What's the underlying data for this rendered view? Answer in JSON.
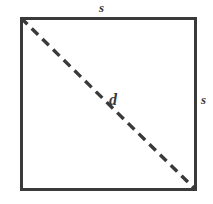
{
  "figure": {
    "kind": "geometry-diagram",
    "shape": "square-with-diagonal",
    "background_color": "#ffffff",
    "stroke_color": "#3a3a3a",
    "labels": {
      "side_top": "s",
      "side_right": "s",
      "diagonal": "d"
    },
    "square": {
      "x": 20,
      "y": 17,
      "width": 176,
      "height": 173,
      "stroke_width": 3
    },
    "diagonal_line": {
      "x1": 21,
      "y1": 18,
      "x2": 195,
      "y2": 189,
      "stroke_width": 3.4,
      "dash": "9 6",
      "style": "dashed"
    }
  }
}
